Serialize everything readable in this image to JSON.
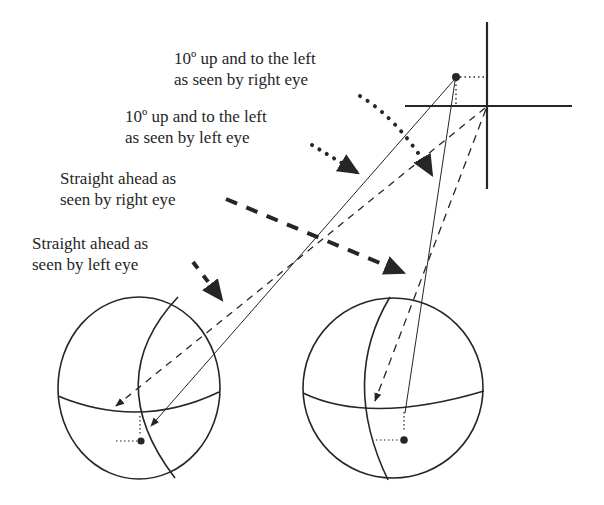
{
  "diagram": {
    "type": "binocular-visual-direction",
    "colors": {
      "ink": "#262626",
      "background": "#ffffff"
    },
    "labels": [
      {
        "id": "up-left-right-eye",
        "lines": [
          "10º up and to the left",
          "as seen by right eye"
        ],
        "arrow_style": "dotted"
      },
      {
        "id": "up-left-left-eye",
        "lines": [
          "10º up and to the left",
          "as seen by left eye"
        ],
        "arrow_style": "dotted"
      },
      {
        "id": "straight-ahead-right-eye",
        "lines": [
          "Straight ahead as",
          "seen by right eye"
        ],
        "arrow_style": "dashed"
      },
      {
        "id": "straight-ahead-left-eye",
        "lines": [
          "Straight ahead as",
          "seen by left eye"
        ],
        "arrow_style": "dashed"
      }
    ],
    "nodes": [
      {
        "id": "fixation-cross",
        "description": "crosshair marking straight-ahead fixation point"
      },
      {
        "id": "target-point",
        "description": "dot 10º up and to the left of fixation"
      },
      {
        "id": "left-eye",
        "description": "left eyeball sphere with equator and meridian"
      },
      {
        "id": "right-eye",
        "description": "right eyeball sphere with equator and meridian"
      }
    ],
    "edges": [
      {
        "from": "fixation-cross",
        "to": "left-eye",
        "style": "dashed",
        "meaning": "line of sight straight ahead to fovea"
      },
      {
        "from": "fixation-cross",
        "to": "right-eye",
        "style": "dashed",
        "meaning": "line of sight straight ahead to fovea"
      },
      {
        "from": "target-point",
        "to": "left-eye",
        "style": "solid",
        "meaning": "image of target below-right of fovea"
      },
      {
        "from": "target-point",
        "to": "right-eye",
        "style": "solid",
        "meaning": "image of target below-right of fovea"
      }
    ]
  }
}
